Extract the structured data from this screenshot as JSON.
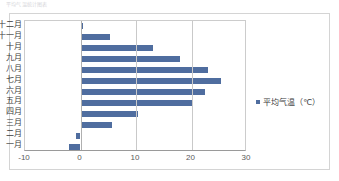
{
  "document": {
    "top_text": "平均气温统计图表"
  },
  "chart_data": {
    "type": "bar",
    "orientation": "horizontal",
    "title": "",
    "xlabel": "",
    "ylabel": "",
    "xlim": [
      -10,
      30
    ],
    "xticks": [
      -10,
      0,
      10,
      20,
      30
    ],
    "xtick_labels": [
      "-10",
      "0",
      "10",
      "20",
      "30"
    ],
    "grid": true,
    "legend_position": "right",
    "series_color": "#4f6d9f",
    "categories": [
      "十二月",
      "十一月",
      "十月",
      "九月",
      "八月",
      "七月",
      "六月",
      "五月",
      "四月",
      "三月",
      "二月",
      "一月"
    ],
    "series": [
      {
        "name": "平均气温（℃）",
        "values": [
          0.5,
          5.3,
          13.0,
          18.0,
          23.0,
          25.3,
          22.5,
          20.0,
          10.3,
          5.7,
          -0.8,
          -2.0
        ]
      }
    ]
  },
  "legend": {
    "marker": "square-marker",
    "label": "平均气温（℃）"
  }
}
